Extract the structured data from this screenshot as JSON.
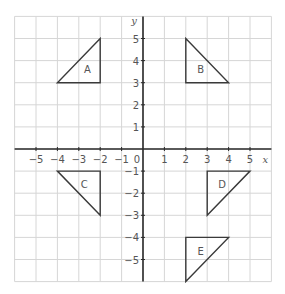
{
  "diagram": {
    "type": "coordinate-grid-transformations",
    "x_axis": {
      "label": "x",
      "range": [
        -6,
        6
      ],
      "tick_labels": [
        "−5",
        "−4",
        "−3",
        "−2",
        "−1",
        "1",
        "2",
        "3",
        "4",
        "5"
      ],
      "origin_label": "0"
    },
    "y_axis": {
      "label": "y",
      "range": [
        -6,
        6
      ],
      "tick_labels": [
        "5",
        "4",
        "3",
        "2",
        "1",
        "−1",
        "−2",
        "−3",
        "−4",
        "−5"
      ]
    },
    "grid": {
      "on": true,
      "color": "#d6d6d6"
    },
    "shapes": [
      {
        "label": "A",
        "vertices": [
          [
            -4,
            3
          ],
          [
            -2,
            3
          ],
          [
            -2,
            5
          ]
        ],
        "label_pos": [
          -2.6,
          3.6
        ]
      },
      {
        "label": "B",
        "vertices": [
          [
            2,
            5
          ],
          [
            2,
            3
          ],
          [
            4,
            3
          ]
        ],
        "label_pos": [
          2.7,
          3.6
        ]
      },
      {
        "label": "C",
        "vertices": [
          [
            -4,
            -1
          ],
          [
            -2,
            -1
          ],
          [
            -2,
            -3
          ]
        ],
        "label_pos": [
          -2.75,
          -1.6
        ]
      },
      {
        "label": "D",
        "vertices": [
          [
            3,
            -1
          ],
          [
            5,
            -1
          ],
          [
            3,
            -3
          ]
        ],
        "label_pos": [
          3.7,
          -1.6
        ]
      },
      {
        "label": "E",
        "vertices": [
          [
            2,
            -4
          ],
          [
            4,
            -4
          ],
          [
            2,
            -6
          ]
        ],
        "label_pos": [
          2.7,
          -4.6
        ]
      }
    ]
  }
}
